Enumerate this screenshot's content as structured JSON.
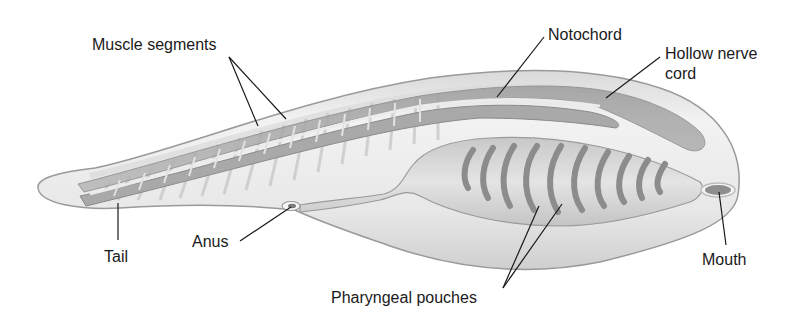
{
  "diagram": {
    "labels": {
      "muscle_segments": "Muscle segments",
      "notochord": "Notochord",
      "hollow_nerve_cord_line1": "Hollow nerve",
      "hollow_nerve_cord_line2": "cord",
      "tail": "Tail",
      "anus": "Anus",
      "pharyngeal_pouches": "Pharyngeal pouches",
      "mouth": "Mouth"
    },
    "colors": {
      "background": "#ffffff",
      "body_fill": "#e6e6e6",
      "body_outline": "#9a9a9a",
      "structure_dark": "#8a8a8a",
      "leader_line": "#1a1a1a",
      "text": "#1a1a1a"
    },
    "pouch_count": 10
  }
}
